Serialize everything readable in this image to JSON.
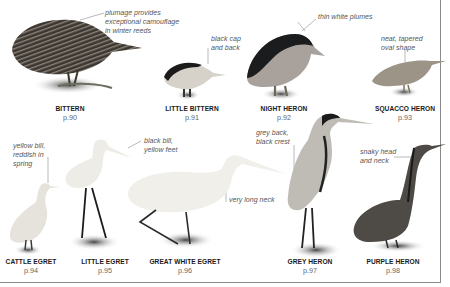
{
  "page": {
    "rule_color": "#8a8a8a",
    "background": "#ffffff"
  },
  "birds": [
    {
      "id": "bittern",
      "name": "BITTERN",
      "page": "p.90",
      "annotation": "plumage provides\nexceptional camouflage\nin winter reeds"
    },
    {
      "id": "little-bittern",
      "name": "LITTLE BITTERN",
      "page": "p.91",
      "annotation": "black cap\nand back"
    },
    {
      "id": "night-heron",
      "name": "NIGHT HERON",
      "page": "p.92",
      "annotation": "thin white plumes"
    },
    {
      "id": "squacco-heron",
      "name": "SQUACCO HERON",
      "page": "p.93",
      "annotation": "neat, tapered\noval shape"
    },
    {
      "id": "cattle-egret",
      "name": "CATTLE EGRET",
      "page": "p.94",
      "annotation": "yellow bill,\nreddish in\nspring"
    },
    {
      "id": "little-egret",
      "name": "LITTLE EGRET",
      "page": "p.95",
      "annotation": "black bill,\nyellow feet"
    },
    {
      "id": "great-white-egret",
      "name": "GREAT WHITE EGRET",
      "page": "p.96",
      "annotation": "very long neck"
    },
    {
      "id": "grey-heron",
      "name": "GREY HERON",
      "page": "p.97",
      "annotation": "grey back,\nblack crest"
    },
    {
      "id": "purple-heron",
      "name": "PURPLE HERON",
      "page": "p.98",
      "annotation": "snaky head\nand neck"
    }
  ]
}
